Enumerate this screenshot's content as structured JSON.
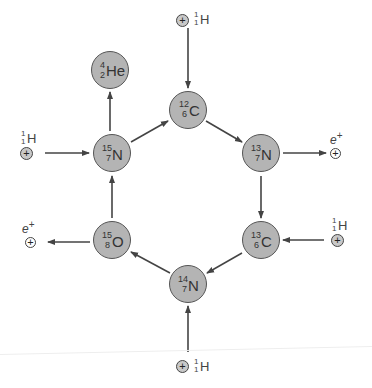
{
  "colors": {
    "node_fill": "#b4b4b4",
    "node_stroke": "#555555",
    "arrow": "#444444"
  },
  "nodes": [
    {
      "id": "he4",
      "mass": "4",
      "z": "2",
      "symbol": "He",
      "cx": 110,
      "cy": 70
    },
    {
      "id": "c12",
      "mass": "12",
      "z": "6",
      "symbol": "C",
      "cx": 188,
      "cy": 110
    },
    {
      "id": "n13",
      "mass": "13",
      "z": "7",
      "symbol": "N",
      "cx": 261,
      "cy": 153
    },
    {
      "id": "c13",
      "mass": "13",
      "z": "6",
      "symbol": "C",
      "cx": 261,
      "cy": 240
    },
    {
      "id": "n14",
      "mass": "14",
      "z": "7",
      "symbol": "N",
      "cx": 188,
      "cy": 284
    },
    {
      "id": "o15",
      "mass": "15",
      "z": "8",
      "symbol": "O",
      "cx": 112,
      "cy": 240
    },
    {
      "id": "n15",
      "mass": "15",
      "z": "7",
      "symbol": "N",
      "cx": 112,
      "cy": 153
    }
  ],
  "inputs": [
    {
      "id": "p-top",
      "particle": "proton",
      "label": {
        "mass": "1",
        "z": "1",
        "symbol": "H"
      }
    },
    {
      "id": "p-left",
      "particle": "proton",
      "label": {
        "mass": "1",
        "z": "1",
        "symbol": "H"
      }
    },
    {
      "id": "p-right",
      "particle": "proton",
      "label": {
        "mass": "1",
        "z": "1",
        "symbol": "H"
      }
    },
    {
      "id": "p-bottom",
      "particle": "proton",
      "label": {
        "mass": "1",
        "z": "1",
        "symbol": "H"
      }
    }
  ],
  "outputs": [
    {
      "id": "e-right",
      "particle": "positron",
      "label": "e",
      "charge": "+"
    },
    {
      "id": "e-left",
      "particle": "positron",
      "label": "e",
      "charge": "+"
    }
  ],
  "glyphs": {
    "plus": "+"
  }
}
